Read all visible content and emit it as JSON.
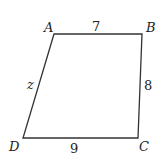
{
  "diagram": {
    "type": "quadrilateral",
    "vertices": [
      {
        "name": "A",
        "x": 54,
        "y": 34,
        "label_x": 44,
        "label_y": 32
      },
      {
        "name": "B",
        "x": 142,
        "y": 34,
        "label_x": 146,
        "label_y": 32
      },
      {
        "name": "C",
        "x": 138,
        "y": 138,
        "label_x": 139,
        "label_y": 151
      },
      {
        "name": "D",
        "x": 23,
        "y": 138,
        "label_x": 9,
        "label_y": 151
      }
    ],
    "sides": [
      {
        "from": "A",
        "to": "B",
        "label": "7",
        "label_x": 92,
        "label_y": 31
      },
      {
        "from": "B",
        "to": "C",
        "label": "8",
        "label_x": 144,
        "label_y": 90
      },
      {
        "from": "C",
        "to": "D",
        "label": "9",
        "label_x": 70,
        "label_y": 153
      },
      {
        "from": "D",
        "to": "A",
        "label": "z",
        "label_x": 27,
        "label_y": 89
      }
    ],
    "stroke_color": "#333333"
  }
}
